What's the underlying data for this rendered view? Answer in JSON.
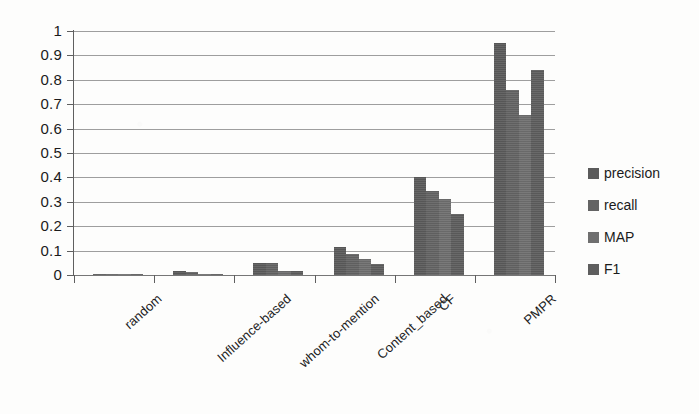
{
  "chart_data": {
    "type": "bar",
    "title": "",
    "subtitle": "",
    "xlabel": "",
    "ylabel": "",
    "ylim": [
      0,
      1
    ],
    "ytick_labels": [
      "1",
      "0.9",
      "0.8",
      "0.7",
      "0.6",
      "0.5",
      "0.4",
      "0.3",
      "0.2",
      "0.1",
      "0"
    ],
    "ytick_values": [
      1,
      0.9,
      0.8,
      0.7,
      0.6,
      0.5,
      0.4,
      0.3,
      0.2,
      0.1,
      0
    ],
    "grid": true,
    "grid_axis": "y",
    "legend_position": "right",
    "categories": [
      "random",
      "Influence-based",
      "whom-to-mention",
      "Content_based",
      "CF",
      "PMPR"
    ],
    "series": [
      {
        "name": "precision",
        "color": "#5b5b5b",
        "values": [
          0.005,
          0.015,
          0.05,
          0.115,
          0.4,
          0.95
        ]
      },
      {
        "name": "recall",
        "color": "#646464",
        "values": [
          0.004,
          0.013,
          0.048,
          0.085,
          0.345,
          0.76
        ]
      },
      {
        "name": "MAP",
        "color": "#6f6f6f",
        "values": [
          0.003,
          0.006,
          0.018,
          0.065,
          0.31,
          0.655
        ]
      },
      {
        "name": "F1",
        "color": "#5e5e5e",
        "values": [
          0.003,
          0.004,
          0.015,
          0.045,
          0.25,
          0.84
        ]
      }
    ]
  },
  "legend": {
    "items": [
      {
        "label": "precision",
        "swatch": "legend-swatch-precision"
      },
      {
        "label": "recall",
        "swatch": "legend-swatch-recall"
      },
      {
        "label": "MAP",
        "swatch": "legend-swatch-map"
      },
      {
        "label": "F1",
        "swatch": "legend-swatch-f1"
      }
    ]
  }
}
